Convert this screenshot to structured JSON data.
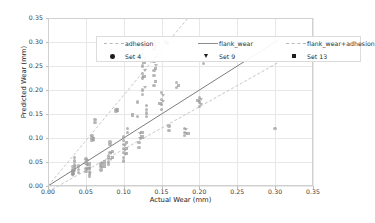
{
  "chart_data": {
    "type": "scatter",
    "title": "",
    "xlabel": "Actual Wear (mm)",
    "ylabel": "Predicted Wear (mm)",
    "xlim": [
      0.0,
      0.35
    ],
    "ylim": [
      0.0,
      0.35
    ],
    "xticks": [
      "0.00",
      "0.05",
      "0.10",
      "0.15",
      "0.20",
      "0.25",
      "0.30",
      "0.35"
    ],
    "yticks": [
      "0.00",
      "0.05",
      "0.10",
      "0.15",
      "0.20",
      "0.25",
      "0.30",
      "0.35"
    ],
    "xtick_values": [
      0.0,
      0.05,
      0.1,
      0.15,
      0.2,
      0.25,
      0.3,
      0.35
    ],
    "ytick_values": [
      0.0,
      0.05,
      0.1,
      0.15,
      0.2,
      0.25,
      0.3,
      0.35
    ],
    "grid": true,
    "legend_position": "upper-left-inside",
    "legend": [
      {
        "label": "adhesion",
        "kind": "line",
        "style": "dashed",
        "color": "#b9b9b9"
      },
      {
        "label": "flank_wear",
        "kind": "line",
        "style": "solid",
        "color": "#8e8e8e"
      },
      {
        "label": "flank_wear+adhesion",
        "kind": "line",
        "style": "dashed",
        "color": "#b9b9b9"
      },
      {
        "label": "Set 4",
        "kind": "marker",
        "style": "circle",
        "color": "#1d1d1d"
      },
      {
        "label": "Set 9",
        "kind": "marker",
        "style": "triangle-down",
        "color": "#1d1d1d"
      },
      {
        "label": "Set 13",
        "kind": "marker",
        "style": "square",
        "color": "#1d1d1d"
      }
    ],
    "lines": [
      {
        "name": "adhesion",
        "style": "dashed",
        "color": "#b8b8b8",
        "x0": 0.0,
        "y0": 0.0,
        "x1": 0.185,
        "y1": 0.35
      },
      {
        "name": "flank_wear",
        "style": "solid",
        "color": "#7d7d7d",
        "x0": 0.0,
        "y0": 0.0,
        "x1": 0.305,
        "y1": 0.305
      },
      {
        "name": "flank_wear+adhesion",
        "style": "dashed",
        "color": "#b8b8b8",
        "x0": 0.0,
        "y0": -0.012,
        "x1": 0.305,
        "y1": 0.258
      }
    ],
    "series": [
      {
        "name": "Set 4",
        "marker": "circle",
        "color": "#9a9a9a",
        "points": [
          [
            0.032,
            0.035
          ],
          [
            0.032,
            0.03
          ],
          [
            0.032,
            0.027
          ],
          [
            0.032,
            0.04
          ],
          [
            0.032,
            0.025
          ],
          [
            0.035,
            0.045
          ],
          [
            0.035,
            0.052
          ],
          [
            0.035,
            0.06
          ],
          [
            0.035,
            0.038
          ],
          [
            0.035,
            0.033
          ],
          [
            0.04,
            0.028
          ],
          [
            0.04,
            0.034
          ],
          [
            0.04,
            0.042
          ],
          [
            0.05,
            0.03
          ],
          [
            0.05,
            0.036
          ],
          [
            0.05,
            0.048
          ],
          [
            0.05,
            0.056
          ],
          [
            0.055,
            0.03
          ],
          [
            0.055,
            0.038
          ],
          [
            0.055,
            0.024
          ],
          [
            0.055,
            0.02
          ],
          [
            0.058,
            0.1
          ],
          [
            0.058,
            0.105
          ],
          [
            0.058,
            0.095
          ],
          [
            0.062,
            0.132
          ],
          [
            0.062,
            0.138
          ],
          [
            0.07,
            0.04
          ],
          [
            0.07,
            0.033
          ],
          [
            0.07,
            0.046
          ],
          [
            0.08,
            0.045
          ],
          [
            0.08,
            0.05
          ],
          [
            0.08,
            0.058
          ],
          [
            0.08,
            0.064
          ],
          [
            0.082,
            0.07
          ],
          [
            0.082,
            0.086
          ],
          [
            0.082,
            0.092
          ],
          [
            0.09,
            0.155
          ],
          [
            0.09,
            0.16
          ],
          [
            0.1,
            0.052
          ],
          [
            0.1,
            0.06
          ],
          [
            0.1,
            0.07
          ],
          [
            0.1,
            0.078
          ],
          [
            0.1,
            0.086
          ],
          [
            0.1,
            0.095
          ],
          [
            0.1,
            0.102
          ],
          [
            0.105,
            0.112
          ],
          [
            0.105,
            0.12
          ],
          [
            0.118,
            0.145
          ],
          [
            0.118,
            0.175
          ],
          [
            0.12,
            0.08
          ],
          [
            0.12,
            0.09
          ],
          [
            0.125,
            0.19
          ],
          [
            0.125,
            0.2
          ],
          [
            0.125,
            0.225
          ],
          [
            0.125,
            0.235
          ],
          [
            0.125,
            0.25
          ],
          [
            0.125,
            0.275
          ],
          [
            0.125,
            0.285
          ],
          [
            0.125,
            0.3
          ],
          [
            0.13,
            0.168
          ],
          [
            0.13,
            0.16
          ],
          [
            0.13,
            0.152
          ],
          [
            0.13,
            0.145
          ],
          [
            0.14,
            0.21
          ],
          [
            0.14,
            0.23
          ],
          [
            0.14,
            0.26
          ],
          [
            0.14,
            0.285
          ],
          [
            0.14,
            0.3
          ],
          [
            0.14,
            0.24
          ],
          [
            0.15,
            0.195
          ],
          [
            0.15,
            0.18
          ],
          [
            0.15,
            0.17
          ],
          [
            0.15,
            0.16
          ],
          [
            0.155,
            0.3
          ],
          [
            0.16,
            0.125
          ],
          [
            0.16,
            0.115
          ],
          [
            0.17,
            0.215
          ],
          [
            0.17,
            0.205
          ],
          [
            0.18,
            0.12
          ],
          [
            0.18,
            0.112
          ],
          [
            0.18,
            0.105
          ],
          [
            0.2,
            0.175
          ],
          [
            0.2,
            0.185
          ],
          [
            0.2,
            0.165
          ],
          [
            0.205,
            0.255
          ],
          [
            0.3,
            0.12
          ]
        ]
      },
      {
        "name": "Set 9",
        "marker": "triangle-down",
        "color": "#9a9a9a",
        "points": [
          [
            0.033,
            0.03
          ],
          [
            0.033,
            0.022
          ],
          [
            0.036,
            0.04
          ],
          [
            0.052,
            0.034
          ],
          [
            0.052,
            0.043
          ],
          [
            0.052,
            0.052
          ],
          [
            0.056,
            0.026
          ],
          [
            0.072,
            0.038
          ],
          [
            0.072,
            0.047
          ],
          [
            0.083,
            0.055
          ],
          [
            0.083,
            0.068
          ],
          [
            0.102,
            0.065
          ],
          [
            0.102,
            0.074
          ],
          [
            0.102,
            0.083
          ],
          [
            0.122,
            0.098
          ],
          [
            0.122,
            0.108
          ],
          [
            0.128,
            0.205
          ],
          [
            0.128,
            0.24
          ],
          [
            0.128,
            0.265
          ],
          [
            0.143,
            0.25
          ],
          [
            0.143,
            0.268
          ],
          [
            0.152,
            0.188
          ],
          [
            0.152,
            0.175
          ],
          [
            0.182,
            0.118
          ],
          [
            0.182,
            0.108
          ],
          [
            0.202,
            0.18
          ],
          [
            0.202,
            0.17
          ]
        ]
      },
      {
        "name": "Set 13",
        "marker": "square",
        "color": "#9a9a9a",
        "points": [
          [
            0.034,
            0.032
          ],
          [
            0.034,
            0.026
          ],
          [
            0.054,
            0.037
          ],
          [
            0.054,
            0.046
          ],
          [
            0.06,
            0.098
          ],
          [
            0.075,
            0.042
          ],
          [
            0.075,
            0.05
          ],
          [
            0.085,
            0.06
          ],
          [
            0.085,
            0.072
          ],
          [
            0.092,
            0.158
          ],
          [
            0.104,
            0.068
          ],
          [
            0.104,
            0.078
          ],
          [
            0.104,
            0.09
          ],
          [
            0.112,
            0.148
          ],
          [
            0.124,
            0.102
          ],
          [
            0.124,
            0.112
          ],
          [
            0.127,
            0.228
          ],
          [
            0.127,
            0.258
          ],
          [
            0.127,
            0.292
          ],
          [
            0.142,
            0.218
          ],
          [
            0.142,
            0.245
          ],
          [
            0.142,
            0.292
          ],
          [
            0.148,
            0.172
          ],
          [
            0.158,
            0.298
          ],
          [
            0.172,
            0.21
          ],
          [
            0.185,
            0.11
          ],
          [
            0.198,
            0.178
          ]
        ]
      }
    ]
  }
}
